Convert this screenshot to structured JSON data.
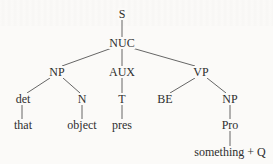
{
  "diagram": {
    "type": "syntax-tree",
    "nodes": {
      "S": {
        "label": "S",
        "x": 122,
        "y": 14
      },
      "NUC": {
        "label": "NUC",
        "x": 122,
        "y": 43
      },
      "NP1": {
        "label": "NP",
        "x": 57,
        "y": 72
      },
      "AUX": {
        "label": "AUX",
        "x": 122,
        "y": 72
      },
      "VP": {
        "label": "VP",
        "x": 201,
        "y": 72
      },
      "det": {
        "label": "det",
        "x": 23,
        "y": 99
      },
      "N": {
        "label": "N",
        "x": 82,
        "y": 99
      },
      "T": {
        "label": "T",
        "x": 122,
        "y": 99
      },
      "BE": {
        "label": "BE",
        "x": 165,
        "y": 99
      },
      "NP2": {
        "label": "NP",
        "x": 230,
        "y": 99
      },
      "that": {
        "label": "that",
        "x": 23,
        "y": 125
      },
      "object": {
        "label": "object",
        "x": 82,
        "y": 125
      },
      "pres": {
        "label": "pres",
        "x": 122,
        "y": 125
      },
      "Pro": {
        "label": "Pro",
        "x": 230,
        "y": 125
      },
      "something_Q": {
        "label": "something + Q",
        "x": 230,
        "y": 152
      }
    },
    "edges": [
      [
        "S",
        "NUC"
      ],
      [
        "NUC",
        "NP1"
      ],
      [
        "NUC",
        "AUX"
      ],
      [
        "NUC",
        "VP"
      ],
      [
        "NP1",
        "det"
      ],
      [
        "NP1",
        "N"
      ],
      [
        "AUX",
        "T"
      ],
      [
        "VP",
        "BE"
      ],
      [
        "VP",
        "NP2"
      ],
      [
        "det",
        "that"
      ],
      [
        "N",
        "object"
      ],
      [
        "T",
        "pres"
      ],
      [
        "NP2",
        "Pro"
      ],
      [
        "Pro",
        "something_Q"
      ]
    ]
  },
  "colors": {
    "background": "#fbfaf8",
    "text": "#2e2e2e",
    "line": "#555555"
  }
}
